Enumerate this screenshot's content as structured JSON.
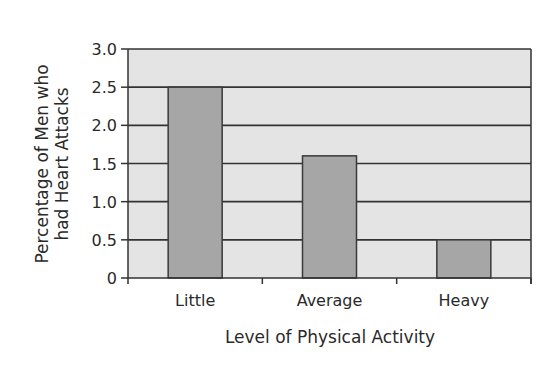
{
  "chart_data": {
    "type": "bar",
    "title": "",
    "categories": [
      "Little",
      "Average",
      "Heavy"
    ],
    "values": [
      2.5,
      1.6,
      0.5
    ],
    "xlabel": "Level of Physical Activity",
    "ylabel": "Percentage of Men who had Heart Attacks",
    "ylabel_lines": [
      "Percentage of Men who",
      "had Heart Attacks"
    ],
    "ylim": [
      0,
      3.0
    ],
    "yticks": [
      0,
      0.5,
      1.0,
      1.5,
      2.0,
      2.5,
      3.0
    ],
    "ytick_labels": [
      "0",
      "0.5",
      "1.0",
      "1.5",
      "2.0",
      "2.5",
      "3.0"
    ],
    "grid": true,
    "legend": null
  },
  "colors": {
    "plot_background": "#e4e4e4",
    "bar_fill": "#a6a6a6",
    "bar_stroke": "#3a3a3a",
    "gridline": "#333333",
    "axis": "#333333"
  }
}
